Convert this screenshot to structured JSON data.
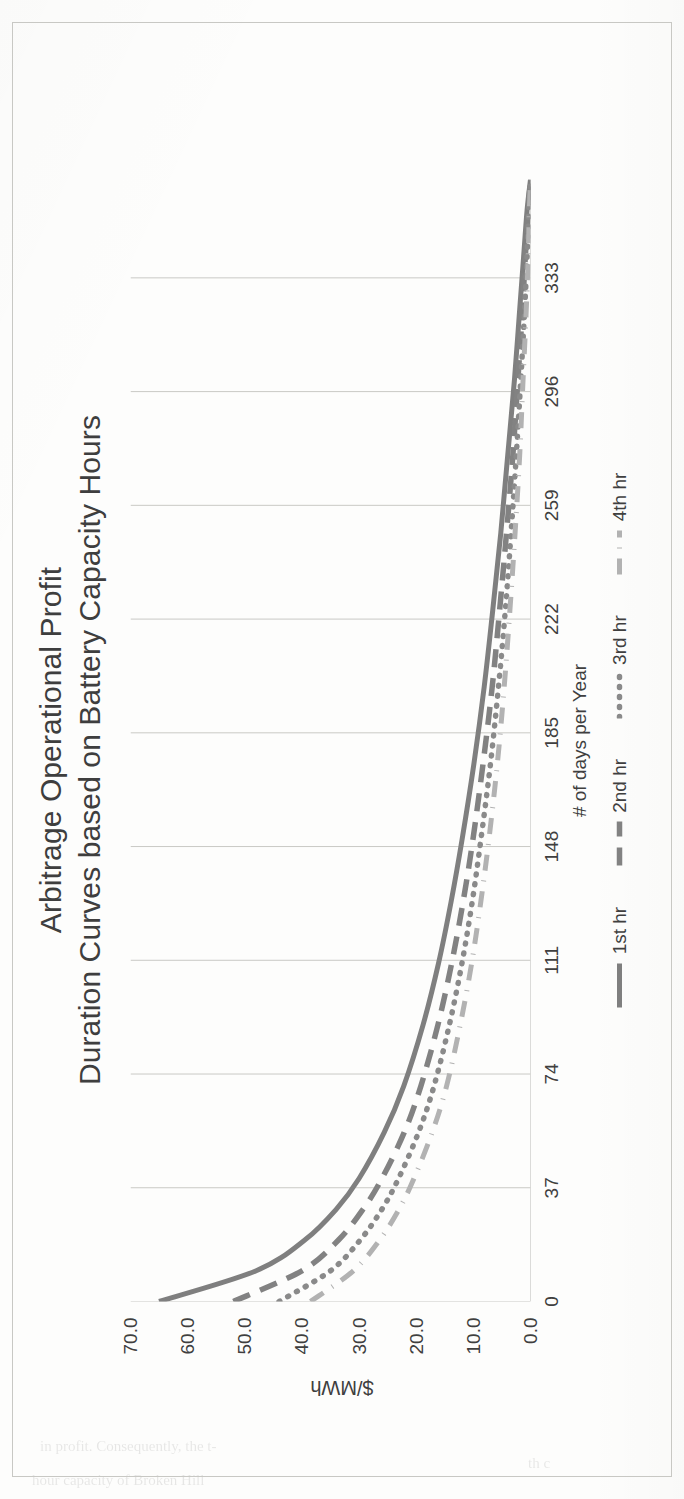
{
  "page": {
    "bleed_through_lines": [
      "in profit. Consequently, the t-",
      "hour capacity of Broken Hill",
      "th c"
    ]
  },
  "chart_data": {
    "type": "line",
    "title": "Arbitrage Operational Profit",
    "subtitle": "Duration Curves based on Battery Capacity Hours",
    "title_lines": [
      "Arbitrage Operational Profit",
      "Duration Curves based on Battery Capacity Hours"
    ],
    "xlabel": "# of days per Year",
    "ylabel": "$/MWh",
    "grid": true,
    "grid_axis": "x",
    "legend_position": "bottom",
    "xlim": [
      0,
      365
    ],
    "ylim": [
      0,
      70
    ],
    "xticks": [
      "0",
      "37",
      "74",
      "111",
      "148",
      "185",
      "222",
      "259",
      "296",
      "333"
    ],
    "xtick_values": [
      0,
      37,
      74,
      111,
      148,
      185,
      222,
      259,
      296,
      333
    ],
    "yticks": [
      "0.0",
      "10.0",
      "20.0",
      "30.0",
      "40.0",
      "50.0",
      "60.0",
      "70.0"
    ],
    "ytick_values": [
      0,
      10,
      20,
      30,
      40,
      50,
      60,
      70
    ],
    "x": [
      0,
      10,
      20,
      30,
      40,
      55,
      70,
      90,
      110,
      130,
      150,
      175,
      200,
      225,
      250,
      275,
      300,
      320,
      340,
      355,
      365
    ],
    "series": [
      {
        "name": "1st hr",
        "style": "solid",
        "color": "#7f7f7f",
        "values": [
          65.0,
          48.0,
          39.5,
          34.0,
          30.0,
          25.6,
          22.2,
          18.8,
          16.1,
          13.9,
          12.0,
          9.9,
          8.1,
          6.6,
          5.2,
          4.0,
          2.8,
          2.0,
          1.2,
          0.6,
          0.0
        ]
      },
      {
        "name": "2nd hr",
        "style": "dashed",
        "color": "#828282",
        "values": [
          52.0,
          40.0,
          33.6,
          29.3,
          26.0,
          22.1,
          19.2,
          16.2,
          13.8,
          11.8,
          10.1,
          8.3,
          6.7,
          5.4,
          4.2,
          3.1,
          2.2,
          1.5,
          0.9,
          0.4,
          0.0
        ]
      },
      {
        "name": "3rd hr",
        "style": "dotted",
        "color": "#8a8a8a",
        "values": [
          44.0,
          35.0,
          29.8,
          26.0,
          23.1,
          19.6,
          16.9,
          14.2,
          12.0,
          10.2,
          8.7,
          7.0,
          5.6,
          4.4,
          3.4,
          2.5,
          1.7,
          1.1,
          0.6,
          0.3,
          0.0
        ]
      },
      {
        "name": "4th hr",
        "style": "dashdot",
        "color": "#b2b2b2",
        "values": [
          38.5,
          31.0,
          26.4,
          23.0,
          20.4,
          17.2,
          14.7,
          12.3,
          10.3,
          8.7,
          7.3,
          5.8,
          4.6,
          3.6,
          2.7,
          1.9,
          1.3,
          0.8,
          0.4,
          0.2,
          0.0
        ]
      }
    ]
  }
}
